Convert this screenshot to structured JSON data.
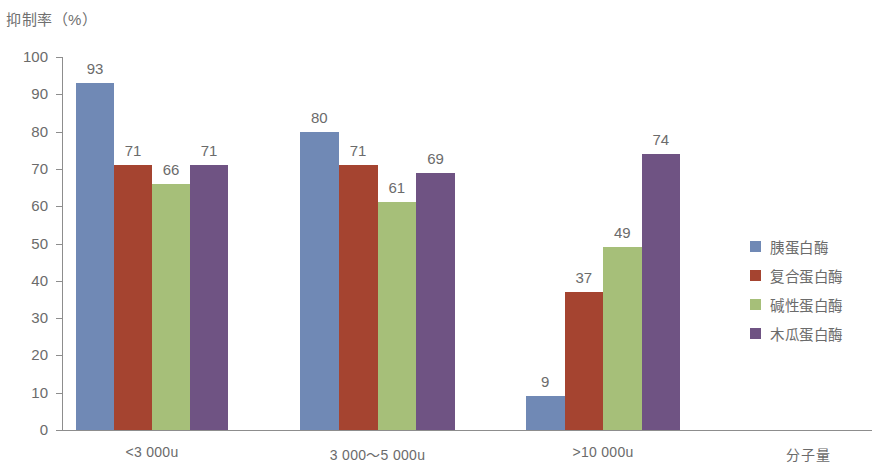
{
  "chart_data": {
    "type": "bar",
    "title": "抑制率（%）",
    "ylabel": "抑制率（%）",
    "xlabel": "分子量",
    "ylim": [
      0,
      100
    ],
    "ytick_labels": [
      "100",
      "90",
      "80",
      "70",
      "60",
      "50",
      "40",
      "30",
      "20",
      "10",
      "0"
    ],
    "ytick_values": [
      100,
      90,
      80,
      70,
      60,
      50,
      40,
      30,
      20,
      10,
      0
    ],
    "grid": false,
    "legend_position": "right",
    "categories": [
      "<3 000u",
      "3 000～5 000u",
      ">10 000u"
    ],
    "series": [
      {
        "name": "胰蛋白酶",
        "color": "#7089b5",
        "values": [
          93,
          80,
          9
        ]
      },
      {
        "name": "复合蛋白酶",
        "color": "#a54430",
        "values": [
          71,
          71,
          37
        ]
      },
      {
        "name": "碱性蛋白酶",
        "color": "#a6bf79",
        "values": [
          66,
          61,
          49
        ]
      },
      {
        "name": "木瓜蛋白酶",
        "color": "#6f5383",
        "values": [
          71,
          69,
          74
        ]
      }
    ],
    "bar_value_labels": [
      [
        "93",
        "71",
        "66",
        "71"
      ],
      [
        "80",
        "71",
        "61",
        "69"
      ],
      [
        "9",
        "37",
        "49",
        "74"
      ]
    ],
    "axis_color": "#8d8d8d",
    "text_color": "#6b6b6b",
    "background": "#ffffff"
  }
}
